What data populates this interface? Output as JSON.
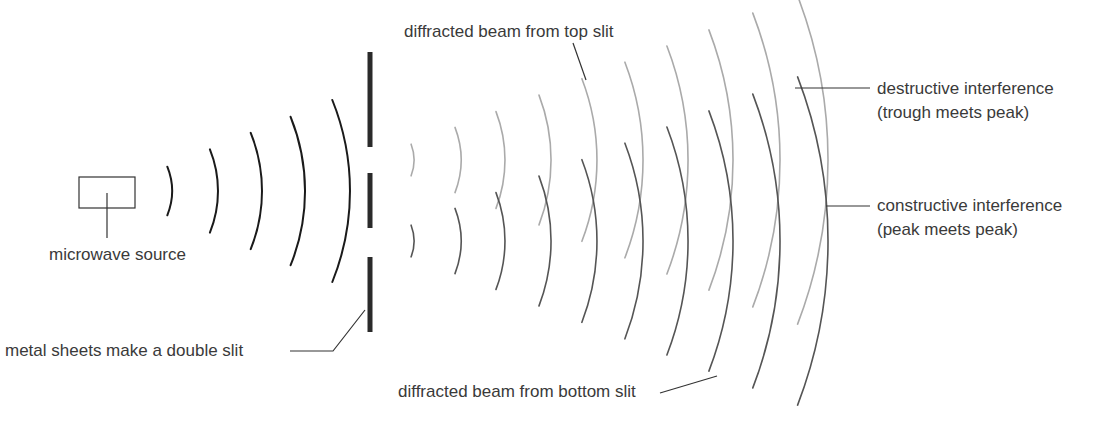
{
  "diagram": {
    "labels": {
      "source": "microwave source",
      "slit": "metal sheets make a double slit",
      "top_beam": "diffracted beam from top slit",
      "bottom_beam": "diffracted beam from bottom slit",
      "destructive_1": "destructive interference",
      "destructive_2": "(trough meets peak)",
      "constructive_1": "constructive interference",
      "constructive_2": "(peak meets peak)"
    },
    "colors": {
      "incident_wave": "#1a1a1a",
      "top_slit_wave": "#aaaaaa",
      "bottom_slit_wave": "#555555",
      "barrier": "#2a2a2a",
      "leader": "#333333"
    },
    "source_box": {
      "x": 79,
      "y": 177,
      "w": 56,
      "h": 31
    },
    "incident_waves": {
      "cx": 107,
      "cy": 191,
      "radii": [
        65,
        111,
        155,
        198,
        243
      ],
      "half_angle_deg": 22
    },
    "barrier_segments": [
      {
        "x": 370,
        "y1": 52,
        "y2": 147
      },
      {
        "x": 370,
        "y1": 173,
        "y2": 228
      },
      {
        "x": 370,
        "y1": 257,
        "y2": 332
      }
    ],
    "diffracted_waves": {
      "origin_x": 370,
      "top_slit_y": 160,
      "bottom_slit_y": 241,
      "radii": [
        44,
        91,
        135,
        181,
        227,
        273,
        318,
        363,
        410,
        458
      ],
      "half_angle_deg": 21
    }
  }
}
